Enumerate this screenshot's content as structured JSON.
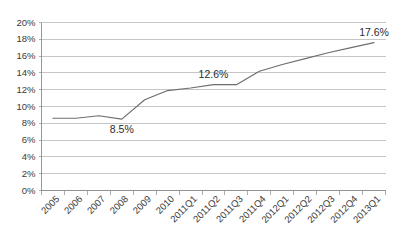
{
  "chart_data": {
    "type": "line",
    "title": "",
    "subtitle": "",
    "xlabel": "",
    "ylabel": "",
    "categories": [
      "2005",
      "2006",
      "2007",
      "2008",
      "2009",
      "2010",
      "2011Q1",
      "2011Q2",
      "2011Q3",
      "2011Q4",
      "2012Q1",
      "2012Q2",
      "2012Q3",
      "2012Q4",
      "2013Q1"
    ],
    "series": [
      {
        "name": "",
        "values": [
          8.6,
          8.6,
          8.9,
          8.5,
          10.8,
          11.9,
          12.2,
          12.6,
          12.6,
          14.2,
          15.0,
          15.7,
          16.4,
          17.0,
          17.6
        ]
      }
    ],
    "ylim": [
      0,
      20
    ],
    "ytick_values": [
      0,
      2,
      4,
      6,
      8,
      10,
      12,
      14,
      16,
      18,
      20
    ],
    "ytick_labels": [
      "0%",
      "2%",
      "4%",
      "6%",
      "8%",
      "10%",
      "12%",
      "14%",
      "16%",
      "18%",
      "20%"
    ],
    "grid": true,
    "legend": false,
    "legend_position": "none",
    "line_color": "#6e6e6e",
    "grid_color": "#b8b8b8",
    "axis_color": "#8c8c8c",
    "annotations": [
      {
        "label": "8.5%",
        "category": "2008",
        "value": 8.5,
        "placement": "below"
      },
      {
        "label": "12.6%",
        "category": "2011Q2",
        "value": 12.6,
        "placement": "above"
      },
      {
        "label": "17.6%",
        "category": "2013Q1",
        "value": 17.6,
        "placement": "above"
      }
    ]
  }
}
